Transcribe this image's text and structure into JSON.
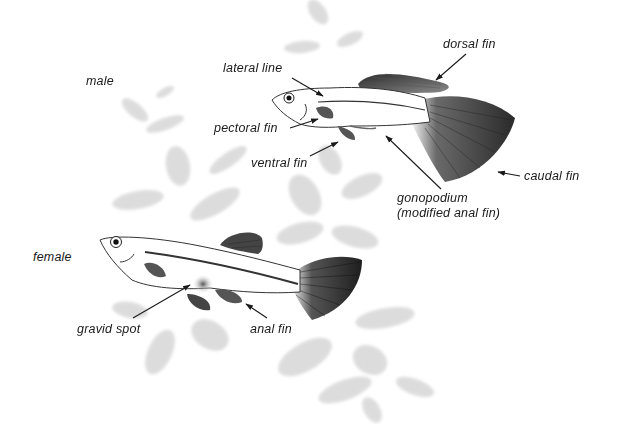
{
  "diagram": {
    "fish": [
      {
        "id": "male",
        "label": "male",
        "parts": [
          {
            "id": "lateral-line",
            "label": "lateral line"
          },
          {
            "id": "dorsal-fin",
            "label": "dorsal fin"
          },
          {
            "id": "pectoral-fin",
            "label": "pectoral fin"
          },
          {
            "id": "ventral-fin",
            "label": "ventral fin"
          },
          {
            "id": "caudal-fin",
            "label": "caudal fin"
          },
          {
            "id": "gonopodium",
            "label": "gonopodium\n(modified anal fin)"
          }
        ]
      },
      {
        "id": "female",
        "label": "female",
        "parts": [
          {
            "id": "gravid-spot",
            "label": "gravid spot"
          },
          {
            "id": "anal-fin",
            "label": "anal fin"
          }
        ]
      }
    ],
    "colors": {
      "ink": "#1a1a1a",
      "fin_dark": "#3a3a3a",
      "plant": "#d6d6d6",
      "background": "#ffffff"
    }
  }
}
